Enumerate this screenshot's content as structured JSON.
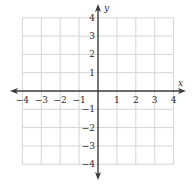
{
  "chart_data": {
    "type": "scatter",
    "title": "",
    "xlabel": "x",
    "ylabel": "y",
    "xlim": [
      -4,
      4
    ],
    "ylim": [
      -4,
      4
    ],
    "grid": true,
    "x_ticks": [
      -4,
      -3,
      -2,
      -1,
      1,
      2,
      3,
      4
    ],
    "y_ticks": [
      4,
      3,
      2,
      1,
      -1,
      -2,
      -3,
      -4
    ],
    "x_tick_labels": [
      "−4",
      "−3",
      "−2",
      "−1",
      "1",
      "2",
      "3",
      "4"
    ],
    "y_tick_labels": [
      "4",
      "3",
      "2",
      "1",
      "−1",
      "−2",
      "−3",
      "−4"
    ],
    "series": [],
    "legend": null
  },
  "colors": {
    "grid": "#d4d4d4",
    "axis": "#3a3a3a",
    "text": "#2a2a2a"
  }
}
